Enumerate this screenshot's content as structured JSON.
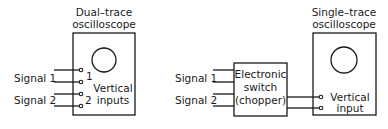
{
  "left_setup": {
    "scope_title_line1": "Dual–trace",
    "scope_title_line2": "oscilloscope",
    "inputs_label_line1": "Vertical",
    "inputs_label_line2": "inputs",
    "channel_1": "1",
    "channel_2": "2",
    "signal_1": "Signal 1",
    "signal_2": "Signal 2"
  },
  "right_setup": {
    "switch_line1": "Electronic",
    "switch_line2": "switch",
    "switch_line3": "(chopper)",
    "scope_title_line1": "Single–trace",
    "scope_title_line2": "oscilloscope",
    "input_label_line1": "Vertical",
    "input_label_line2": "input",
    "signal_1": "Signal 1",
    "signal_2": "Signal 2"
  },
  "colors": {
    "ink": "#1a1a1a",
    "background": "#ffffff"
  }
}
